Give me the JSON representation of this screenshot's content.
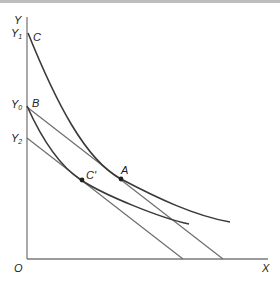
{
  "diagram": {
    "axes": {
      "y_label": "Y",
      "x_label": "X",
      "origin_label": "O"
    },
    "y_intercept_labels": [
      {
        "base": "Y",
        "sub": "1"
      },
      {
        "base": "Y",
        "sub": "0"
      },
      {
        "base": "Y",
        "sub": "2"
      }
    ],
    "curve_labels": {
      "upper_curve": "C",
      "lower_curve_start": "B"
    },
    "points": [
      {
        "label": "A"
      },
      {
        "label": "C'"
      }
    ],
    "colors": {
      "axis": "#7a7a7a",
      "curve": "#3a3a3a",
      "line": "#6e6e6e"
    }
  }
}
